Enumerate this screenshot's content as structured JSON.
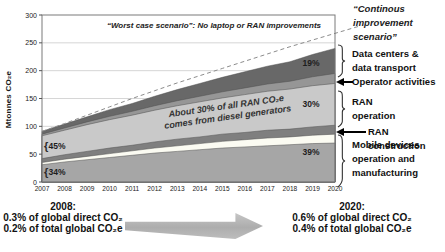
{
  "y_axis": {
    "title": "Mtonnes CO₂e",
    "ticks": [
      0,
      50,
      100,
      150,
      200,
      250,
      300
    ]
  },
  "x_axis": {
    "years": [
      2007,
      2008,
      2009,
      2010,
      2011,
      2012,
      2013,
      2014,
      2015,
      2016,
      2017,
      2018,
      2019,
      2020
    ]
  },
  "plot": {
    "worst_case_title": "“Worst case scenario”: No laptop or RAN improvements",
    "diesel_annotation": "About 30% of all RAN CO₂e\ncomes from diesel generators"
  },
  "chart_data": {
    "type": "area",
    "stacked": true,
    "title": "“Worst case scenario”: No laptop or RAN improvements",
    "ylabel": "Mtonnes CO₂e",
    "ylim": [
      0,
      300
    ],
    "yticks": [
      0,
      50,
      100,
      150,
      200,
      250,
      300
    ],
    "x": [
      2007,
      2008,
      2009,
      2010,
      2011,
      2012,
      2013,
      2014,
      2015,
      2016,
      2017,
      2018,
      2019,
      2020
    ],
    "series": [
      {
        "name": "Mobile devices operation and manufacturing (dark sub-band)",
        "color": "#a6a6a6",
        "values": [
          31,
          36,
          40,
          44,
          48,
          52,
          55,
          58,
          61,
          63,
          65,
          67,
          69,
          70
        ]
      },
      {
        "name": "Mobile devices operation and manufacturing (light sub-band)",
        "color": "#fbfbf2",
        "values": [
          4,
          5,
          6,
          7,
          8,
          9,
          10,
          11,
          12,
          13,
          14,
          14,
          15,
          16
        ]
      },
      {
        "name": "RAN construction",
        "color": "#7f7f7f",
        "values": [
          7,
          8,
          9,
          10,
          10,
          11,
          12,
          12,
          13,
          13,
          14,
          14,
          15,
          16
        ]
      },
      {
        "name": "RAN operation",
        "color": "#c9c9c9",
        "values": [
          41,
          44,
          48,
          51,
          54,
          57,
          60,
          63,
          65,
          68,
          70,
          72,
          74,
          75
        ]
      },
      {
        "name": "Operator activities",
        "color": "#969696",
        "values": [
          3,
          4,
          5,
          6,
          7,
          8,
          9,
          10,
          11,
          12,
          13,
          14,
          16,
          18
        ]
      },
      {
        "name": "Data centers & data transport",
        "color": "#686868",
        "values": [
          5,
          7,
          9,
          12,
          14,
          17,
          20,
          23,
          26,
          29,
          32,
          35,
          40,
          45
        ]
      }
    ],
    "worst_case_line": {
      "name": "“Worst case scenario”: No laptop or RAN improvements",
      "style": "dashed",
      "color": "#8c8c8c",
      "values": [
        91,
        105,
        120,
        135,
        150,
        164,
        178,
        191,
        204,
        217,
        230,
        243,
        255,
        267
      ]
    },
    "inline_labels": [
      {
        "text": "45%",
        "refers_to": "RAN operation share in 2008"
      },
      {
        "text": "34%",
        "refers_to": "Mobile devices share in 2008"
      },
      {
        "text": "19%",
        "refers_to": "Data centers & data transport share in 2020"
      },
      {
        "text": "30%",
        "refers_to": "RAN operation share in 2020"
      },
      {
        "text": "39%",
        "refers_to": "Mobile devices share in 2020"
      }
    ]
  },
  "legend": {
    "continuous_scenario": "“Continous\nimprovement\nscenario”",
    "items": [
      {
        "label": "Data centers &\ndata transport",
        "connector": "brace"
      },
      {
        "label": "Operator activities",
        "connector": "arrow"
      },
      {
        "label": "RAN\noperation",
        "connector": "brace"
      },
      {
        "label": "RAN construction",
        "connector": "arrow"
      },
      {
        "label": "Mobile devices\noperation and\nmanufacturing",
        "connector": "brace"
      }
    ]
  },
  "footer": {
    "left": {
      "year": "2008:",
      "line1": "0.3% of global direct CO₂",
      "line2": "0.2% of total global CO₂e"
    },
    "right": {
      "year": "2020:",
      "line1": "0.6% of global direct CO₂",
      "line2": "0.4% of total global CO₂e"
    }
  }
}
